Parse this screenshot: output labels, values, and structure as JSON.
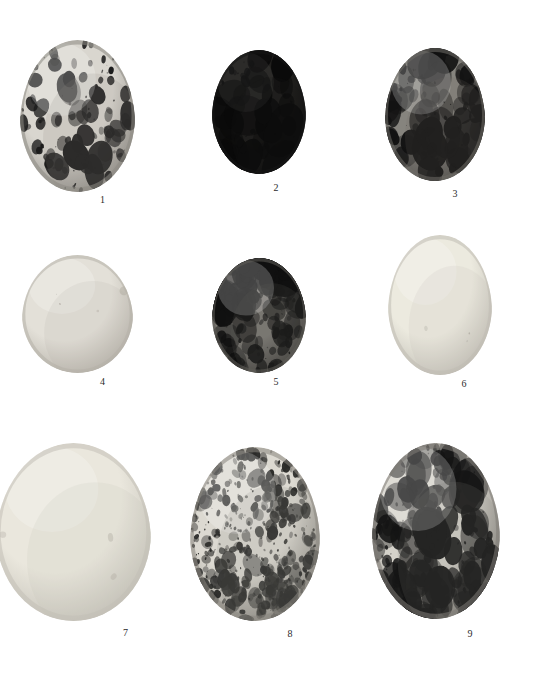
{
  "plate": {
    "width": 550,
    "height": 683,
    "background_color": "#ffffff",
    "layout": "3x3 grid of photographed bird eggs, monochrome halftone plate",
    "label_color": "#2b2b2b"
  },
  "eggs": [
    {
      "number": "1",
      "label": "1",
      "row": 1,
      "column": 1,
      "x": 20,
      "y": 40,
      "width": 115,
      "height": 152,
      "label_x": 45,
      "label_y": 194,
      "ground_color": "#d9d6cf",
      "mark_color": "#1a1a1a",
      "shade_color": "#8d8a84",
      "pattern": "heavily-blotched",
      "speck_density": 110,
      "blotch_size": 9,
      "darkness": 0.42,
      "seed": 11
    },
    {
      "number": "2",
      "label": "2",
      "row": 1,
      "column": 2,
      "x": 212,
      "y": 50,
      "width": 94,
      "height": 124,
      "label_x": 229,
      "label_y": 182,
      "ground_color": "#3a3833",
      "mark_color": "#0a0a0a",
      "shade_color": "#161616",
      "pattern": "near-solid-dark",
      "speck_density": 70,
      "blotch_size": 16,
      "darkness": 0.92,
      "seed": 22
    },
    {
      "number": "3",
      "label": "3",
      "row": 1,
      "column": 3,
      "x": 385,
      "y": 48,
      "width": 100,
      "height": 133,
      "label_x": 405,
      "label_y": 188,
      "ground_color": "#bdbab2",
      "mark_color": "#121212",
      "shade_color": "#6e6b66",
      "pattern": "bold-blotched",
      "speck_density": 95,
      "blotch_size": 14,
      "darkness": 0.58,
      "seed": 33
    },
    {
      "number": "4",
      "label": "4",
      "row": 2,
      "column": 1,
      "x": 22,
      "y": 255,
      "width": 111,
      "height": 118,
      "label_x": 47,
      "label_y": 376,
      "ground_color": "#e3e0d8",
      "mark_color": "#a9a49a",
      "shade_color": "#b5b1a8",
      "pattern": "plain-unmarked",
      "speck_density": 4,
      "blotch_size": 3,
      "darkness": 0.06,
      "seed": 44
    },
    {
      "number": "5",
      "label": "5",
      "row": 2,
      "column": 2,
      "x": 212,
      "y": 258,
      "width": 94,
      "height": 115,
      "label_x": 229,
      "label_y": 376,
      "ground_color": "#b9b5ad",
      "mark_color": "#101010",
      "shade_color": "#5f5c57",
      "pattern": "capped-blotched",
      "speck_density": 120,
      "blotch_size": 12,
      "darkness": 0.62,
      "seed": 55
    },
    {
      "number": "6",
      "label": "6",
      "row": 2,
      "column": 3,
      "x": 388,
      "y": 235,
      "width": 104,
      "height": 140,
      "label_x": 412,
      "label_y": 378,
      "ground_color": "#eceadf",
      "mark_color": "#b0aca2",
      "shade_color": "#bfbcb3",
      "pattern": "plain-unmarked",
      "speck_density": 3,
      "blotch_size": 3,
      "darkness": 0.05,
      "seed": 66
    },
    {
      "number": "7",
      "label": "7",
      "row": 3,
      "column": 1,
      "x": -4,
      "y": 443,
      "width": 155,
      "height": 178,
      "label_x": 48,
      "label_y": 627,
      "ground_color": "#eae7dd",
      "mark_color": "#b3afa5",
      "shade_color": "#c2bfb6",
      "pattern": "plain-unmarked",
      "speck_density": 3,
      "blotch_size": 3,
      "darkness": 0.05,
      "seed": 77
    },
    {
      "number": "8",
      "label": "8",
      "row": 3,
      "column": 2,
      "x": 190,
      "y": 447,
      "width": 130,
      "height": 174,
      "label_x": 225,
      "label_y": 628,
      "ground_color": "#dcd9d1",
      "mark_color": "#2a2a28",
      "shade_color": "#8a8780",
      "pattern": "finely-speckled",
      "speck_density": 420,
      "blotch_size": 4,
      "darkness": 0.3,
      "seed": 88
    },
    {
      "number": "9",
      "label": "9",
      "row": 3,
      "column": 3,
      "x": 372,
      "y": 443,
      "width": 128,
      "height": 176,
      "label_x": 406,
      "label_y": 628,
      "ground_color": "#d5d2ca",
      "mark_color": "#141414",
      "shade_color": "#7d7a74",
      "pattern": "boldly-blotched",
      "speck_density": 180,
      "blotch_size": 11,
      "darkness": 0.45,
      "seed": 99
    }
  ]
}
